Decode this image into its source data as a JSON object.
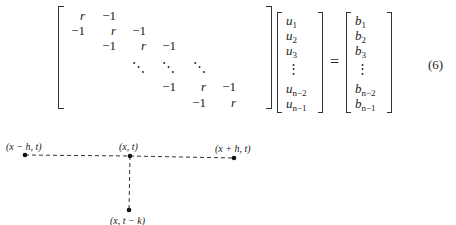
{
  "equation": {
    "number": "(6)",
    "equals": "=",
    "matrix": {
      "rows": [
        [
          "r",
          "−1",
          "",
          "",
          "",
          ""
        ],
        [
          "−1",
          "r",
          "−1",
          "",
          "",
          ""
        ],
        [
          "",
          "−1",
          "r",
          "−1",
          "",
          ""
        ],
        [
          "",
          "",
          "⋱",
          "⋱",
          "⋱",
          ""
        ],
        [
          "",
          "",
          "",
          "−1",
          "r",
          "−1"
        ],
        [
          "",
          "",
          "",
          "",
          "−1",
          "r"
        ]
      ]
    },
    "u_vector": [
      "u1",
      "u2",
      "u3",
      "⋮",
      "u(n−2)",
      "u(n−1)"
    ],
    "b_vector": [
      "b1",
      "b2",
      "b3",
      "⋮",
      "b(n−2)",
      "b(n−1)"
    ],
    "u": {
      "base": "u",
      "s1": "1",
      "s2": "2",
      "s3": "3",
      "sn2": "n−2",
      "sn1": "n−1"
    },
    "b": {
      "base": "b",
      "s1": "1",
      "s2": "2",
      "s3": "3",
      "sn2": "n−2",
      "sn1": "n−1"
    },
    "cells": {
      "r": "r",
      "m1": "−1",
      "dd": "⋱",
      "vd": "⋮"
    }
  },
  "stencil": {
    "points": [
      {
        "id": "left",
        "label": "(x − h, t)"
      },
      {
        "id": "center",
        "label": "(x, t)"
      },
      {
        "id": "right",
        "label": "(x + h, t)"
      },
      {
        "id": "bottom",
        "label": "(x, t − k)"
      }
    ]
  }
}
